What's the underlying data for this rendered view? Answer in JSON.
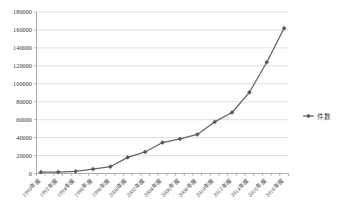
{
  "chart_data": {
    "type": "line",
    "title": "",
    "subtitle": "",
    "xlabel": "",
    "ylabel": "",
    "ylim": [
      0,
      180000
    ],
    "ytick_step": 20000,
    "grid": true,
    "grid_axis": "y",
    "legend_position": "right",
    "yticks": [
      "0",
      "20000",
      "40000",
      "60000",
      "80000",
      "100000",
      "120000",
      "140000",
      "160000",
      "180000"
    ],
    "categories": [
      "1990年度",
      "1991年度",
      "1992年度",
      "1993年度",
      "1994年度",
      "1995年度",
      "1996年度",
      "1997年度",
      "1998年度",
      "1999年度",
      "2000年度",
      "2001年度",
      "2002年度",
      "2003年度",
      "2004年度",
      "2005年度",
      "2006年度",
      "2007年度",
      "2008年度",
      "2009年度",
      "2010年度",
      "2011年度",
      "2012年度",
      "2013年度",
      "2014年度",
      "2015年度",
      "2016年度",
      "2017年度",
      "2018年度"
    ],
    "visible_xtick_labels": [
      "1990年度",
      "1992年度",
      "1994年度",
      "1996年度",
      "1998年度",
      "2000年度",
      "2002年度",
      "2004年度",
      "2006年度",
      "2008年度",
      "2010年度",
      "2012年度",
      "2014年度",
      "2016年度",
      "2018年度"
    ],
    "series": [
      {
        "name": "件数",
        "color": "#666666",
        "marker": "diamond",
        "x": [
          "1990年度",
          "1992年度",
          "1994年度",
          "1996年度",
          "1998年度",
          "2000年度",
          "2002年度",
          "2004年度",
          "2006年度",
          "2008年度",
          "2010年度",
          "2012年度",
          "2014年度",
          "2016年度",
          "2018年度"
        ],
        "values": [
          1500,
          1600,
          2400,
          5000,
          7600,
          18000,
          24000,
          34500,
          38500,
          43500,
          57500,
          68000,
          90500,
          124000,
          162000
        ]
      }
    ],
    "legend": [
      {
        "label": "件数",
        "color": "#666666",
        "marker": "diamond"
      }
    ]
  }
}
